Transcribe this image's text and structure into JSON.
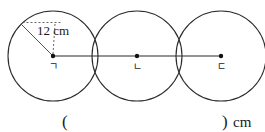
{
  "figure": {
    "type": "geometry-diagram",
    "circles": [
      {
        "center_label": "ㄱ",
        "radius_cm": 12,
        "cx": 53,
        "cy": 56,
        "r": 45
      },
      {
        "center_label": "ㄴ",
        "radius_cm": 12,
        "cx": 137,
        "cy": 56,
        "r": 45
      },
      {
        "center_label": "ㄷ",
        "radius_cm": 12,
        "cx": 221,
        "cy": 56,
        "r": 45
      }
    ],
    "radius_label": "12 cm",
    "center_line": {
      "from": "ㄱ",
      "to": "ㄷ"
    },
    "stroke_color": "#2b2b2b",
    "dot_color": "#111111",
    "leader_color": "#555555"
  },
  "answer": {
    "open_paren": "(",
    "close_paren": ")",
    "unit": "cm",
    "value": ""
  }
}
